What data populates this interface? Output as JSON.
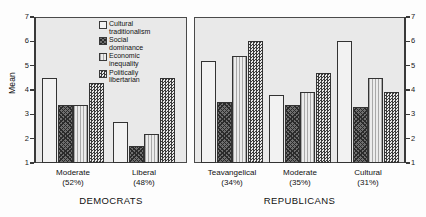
{
  "chart_data": {
    "type": "bar",
    "title": "",
    "xlabel": "",
    "ylabel": "Mean",
    "ylim": [
      1,
      7
    ],
    "yticks": [
      1,
      2,
      3,
      4,
      5,
      6,
      7
    ],
    "grid": false,
    "legend_position": "top-center-inside-left-panel",
    "categories": [
      "Moderate\n(52%)",
      "Liberal\n(48%)",
      "Teavangelical\n(34%)",
      "Moderate\n(35%)",
      "Cultural\n(31%)"
    ],
    "groups": [
      {
        "party": "DEMOCRATS",
        "categories": [
          "Moderate\n(52%)",
          "Liberal\n(48%)"
        ]
      },
      {
        "party": "REPUBLICANS",
        "categories": [
          "Teavangelical\n(34%)",
          "Moderate\n(35%)",
          "Cultural\n(31%)"
        ]
      }
    ],
    "series": [
      {
        "name": "Cultural\ntraditionalism",
        "fill": "f-cultural",
        "values": [
          4.5,
          2.7,
          5.2,
          3.8,
          6.0
        ]
      },
      {
        "name": "Social\ndominance",
        "fill": "f-social",
        "values": [
          3.4,
          1.7,
          3.5,
          3.4,
          3.3
        ]
      },
      {
        "name": "Economic\ninequality",
        "fill": "f-economic",
        "values": [
          3.4,
          2.2,
          5.4,
          3.9,
          4.5
        ]
      },
      {
        "name": "Politically\nlibertarian",
        "fill": "f-libert",
        "values": [
          4.3,
          4.5,
          6.0,
          4.7,
          3.9
        ]
      }
    ]
  },
  "axis": {
    "ylabel": "Mean",
    "ticks": [
      "7",
      "6",
      "5",
      "4",
      "3",
      "2",
      "1"
    ]
  },
  "legend": {
    "items": [
      {
        "label": "Cultural\ntraditionalism",
        "swatch": "f-cultural"
      },
      {
        "label": "Social\ndominance",
        "swatch": "f-social"
      },
      {
        "label": "Economic\ninequality",
        "swatch": "f-economic"
      },
      {
        "label": "Politically\nlibertarian",
        "swatch": "f-libert"
      }
    ]
  },
  "categories": {
    "dem_moderate": "Moderate\n(52%)",
    "dem_liberal": "Liberal\n(48%)",
    "rep_teavangelical": "Teavangelical\n(34%)",
    "rep_moderate": "Moderate\n(35%)",
    "rep_cultural": "Cultural\n(31%)"
  },
  "parties": {
    "democrats": "DEMOCRATS",
    "republicans": "REPUBLICANS"
  }
}
